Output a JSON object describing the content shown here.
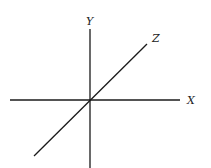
{
  "diagram": {
    "type": "3d-coordinate-axes",
    "colors": {
      "background": "#ffffff",
      "line": "#1a1a1a",
      "label": "#222222"
    },
    "origin": {
      "x": 90,
      "y": 100
    },
    "axes": [
      {
        "id": "x",
        "label": "X",
        "from": {
          "x": 10,
          "y": 100
        },
        "to": {
          "x": 180,
          "y": 100
        },
        "label_pos": {
          "x": 187,
          "y": 104
        }
      },
      {
        "id": "y",
        "label": "Y",
        "from": {
          "x": 90,
          "y": 29
        },
        "to": {
          "x": 90,
          "y": 168
        },
        "label_pos": {
          "x": 86,
          "y": 25
        }
      },
      {
        "id": "z",
        "label": "Z",
        "from": {
          "x": 34,
          "y": 156
        },
        "to": {
          "x": 147,
          "y": 44
        },
        "label_pos": {
          "x": 152,
          "y": 42
        }
      }
    ]
  }
}
